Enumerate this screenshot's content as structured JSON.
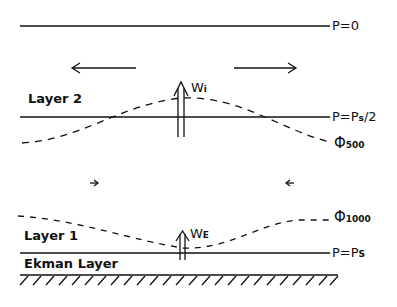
{
  "diagram": {
    "labels": {
      "p_top": "P=0",
      "p_mid": "P=P",
      "p_mid_sub": "s",
      "p_mid_suffix": "/2",
      "p_bottom": "P=P",
      "p_bottom_sub": "S",
      "phi500": "Φ",
      "phi500_sub": "500",
      "phi1000": "Φ",
      "phi1000_sub": "1000",
      "layer2": "Layer  2",
      "layer1": "Layer  1",
      "ekman": "Ekman  Layer",
      "wi": "W",
      "wi_sub": "i",
      "we": "W",
      "we_sub": "E"
    },
    "arrows": {
      "upper_divergence": [
        "left",
        "right"
      ],
      "lower_convergence": [
        "right",
        "left"
      ]
    },
    "colors": {
      "line": "#111111",
      "background": "#ffffff"
    }
  }
}
